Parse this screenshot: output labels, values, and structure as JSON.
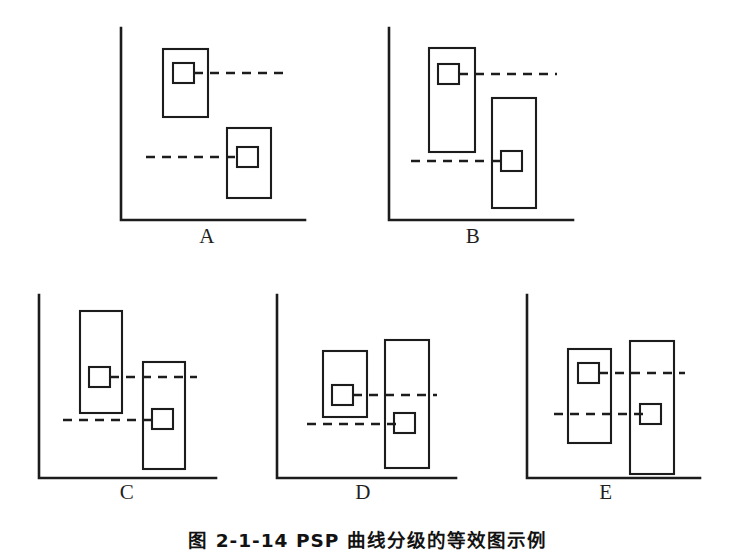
{
  "figure": {
    "caption": "图 2-1-14  PSP 曲线分级的等效图示例",
    "ink_color": "#1c1c1c",
    "background_color": "#ffffff",
    "width": 735,
    "height": 546
  },
  "panels": [
    {
      "id": "A",
      "label": "A",
      "label_x": 207,
      "label_y": 236,
      "axis": {
        "x": 121,
        "y_top": 28,
        "y_base": 220,
        "x_right": 305
      },
      "boxes": [
        {
          "name": "left-range-box",
          "x": 163,
          "y": 49,
          "w": 45,
          "h": 68
        },
        {
          "name": "right-range-box",
          "x": 227,
          "y": 128,
          "w": 44,
          "h": 70
        }
      ],
      "markers": [
        {
          "name": "left-marker",
          "x": 173,
          "y": 63,
          "w": 21,
          "h": 20
        },
        {
          "name": "right-marker",
          "x": 237,
          "y": 147,
          "w": 21,
          "h": 20
        }
      ],
      "dashes": [
        {
          "name": "upper-dash",
          "x1": 194,
          "x2": 290,
          "y": 73
        },
        {
          "name": "lower-dash",
          "x1": 146,
          "x2": 240,
          "y": 157
        }
      ]
    },
    {
      "id": "B",
      "label": "B",
      "label_x": 473,
      "label_y": 236,
      "axis": {
        "x": 389,
        "y_top": 28,
        "y_base": 220,
        "x_right": 573
      },
      "boxes": [
        {
          "name": "left-range-box",
          "x": 429,
          "y": 48,
          "w": 46,
          "h": 104
        },
        {
          "name": "right-range-box",
          "x": 492,
          "y": 98,
          "w": 44,
          "h": 110
        }
      ],
      "markers": [
        {
          "name": "left-marker",
          "x": 438,
          "y": 64,
          "w": 21,
          "h": 20
        },
        {
          "name": "right-marker",
          "x": 501,
          "y": 151,
          "w": 21,
          "h": 20
        }
      ],
      "dashes": [
        {
          "name": "upper-dash",
          "x1": 459,
          "x2": 557,
          "y": 74
        },
        {
          "name": "lower-dash",
          "x1": 411,
          "x2": 505,
          "y": 161
        }
      ]
    },
    {
      "id": "C",
      "label": "C",
      "label_x": 127,
      "label_y": 492,
      "axis": {
        "x": 39,
        "y_top": 295,
        "y_base": 478,
        "x_right": 216
      },
      "boxes": [
        {
          "name": "left-range-box",
          "x": 80,
          "y": 311,
          "w": 42,
          "h": 102
        },
        {
          "name": "right-range-box",
          "x": 143,
          "y": 362,
          "w": 42,
          "h": 107
        }
      ],
      "markers": [
        {
          "name": "left-marker",
          "x": 89,
          "y": 367,
          "w": 21,
          "h": 20
        },
        {
          "name": "right-marker",
          "x": 152,
          "y": 409,
          "w": 21,
          "h": 20
        }
      ],
      "dashes": [
        {
          "name": "upper-dash",
          "x1": 110,
          "x2": 197,
          "y": 377
        },
        {
          "name": "lower-dash",
          "x1": 63,
          "x2": 156,
          "y": 420
        }
      ]
    },
    {
      "id": "D",
      "label": "D",
      "label_x": 363,
      "label_y": 492,
      "axis": {
        "x": 277,
        "y_top": 295,
        "y_base": 478,
        "x_right": 456
      },
      "boxes": [
        {
          "name": "left-range-box",
          "x": 323,
          "y": 351,
          "w": 44,
          "h": 66
        },
        {
          "name": "right-range-box",
          "x": 385,
          "y": 340,
          "w": 44,
          "h": 128
        }
      ],
      "markers": [
        {
          "name": "left-marker",
          "x": 332,
          "y": 385,
          "w": 21,
          "h": 20
        },
        {
          "name": "right-marker",
          "x": 394,
          "y": 413,
          "w": 21,
          "h": 20
        }
      ],
      "dashes": [
        {
          "name": "upper-dash",
          "x1": 353,
          "x2": 437,
          "y": 395
        },
        {
          "name": "lower-dash",
          "x1": 307,
          "x2": 398,
          "y": 424
        }
      ]
    },
    {
      "id": "E",
      "label": "E",
      "label_x": 606,
      "label_y": 492,
      "axis": {
        "x": 527,
        "y_top": 295,
        "y_base": 478,
        "x_right": 700
      },
      "boxes": [
        {
          "name": "left-range-box",
          "x": 568,
          "y": 349,
          "w": 43,
          "h": 94
        },
        {
          "name": "right-range-box",
          "x": 630,
          "y": 341,
          "w": 44,
          "h": 133
        }
      ],
      "markers": [
        {
          "name": "left-marker",
          "x": 578,
          "y": 363,
          "w": 21,
          "h": 20
        },
        {
          "name": "right-marker",
          "x": 640,
          "y": 404,
          "w": 21,
          "h": 20
        }
      ],
      "dashes": [
        {
          "name": "upper-dash",
          "x1": 599,
          "x2": 685,
          "y": 373
        },
        {
          "name": "lower-dash",
          "x1": 554,
          "x2": 644,
          "y": 414
        }
      ]
    }
  ]
}
